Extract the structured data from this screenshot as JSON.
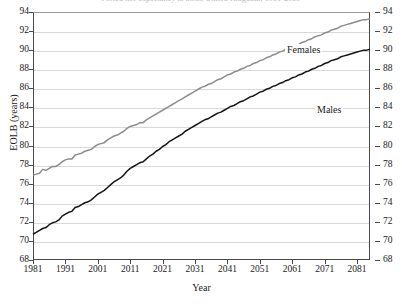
{
  "chart_data": {
    "type": "line",
    "title": "Period life expectancy at birth, United Kingdom, 1981-2085",
    "xlabel": "Year",
    "ylabel": "EOLB (years)",
    "xlim": [
      1981,
      2085
    ],
    "ylim": [
      68,
      94
    ],
    "ytick_step": 2,
    "grid": true,
    "legend_position": "inline-annotation",
    "yticks": [
      68,
      70,
      72,
      74,
      76,
      78,
      80,
      82,
      84,
      86,
      88,
      90,
      92,
      94
    ],
    "xticks": [
      1981,
      1991,
      2001,
      2011,
      2021,
      2031,
      2041,
      2051,
      2061,
      2071,
      2081
    ],
    "x": [
      1981,
      1982,
      1983,
      1984,
      1985,
      1986,
      1987,
      1988,
      1989,
      1990,
      1991,
      1992,
      1993,
      1994,
      1995,
      1996,
      1997,
      1998,
      1999,
      2000,
      2001,
      2002,
      2003,
      2004,
      2005,
      2006,
      2007,
      2008,
      2009,
      2010,
      2011,
      2012,
      2013,
      2014,
      2015,
      2016,
      2017,
      2018,
      2019,
      2020,
      2021,
      2022,
      2023,
      2024,
      2025,
      2026,
      2027,
      2028,
      2029,
      2030,
      2031,
      2032,
      2033,
      2034,
      2035,
      2036,
      2037,
      2038,
      2039,
      2040,
      2041,
      2042,
      2043,
      2044,
      2045,
      2046,
      2047,
      2048,
      2049,
      2050,
      2051,
      2052,
      2053,
      2054,
      2055,
      2056,
      2057,
      2058,
      2059,
      2060,
      2061,
      2062,
      2063,
      2064,
      2065,
      2066,
      2067,
      2068,
      2069,
      2070,
      2071,
      2072,
      2073,
      2074,
      2075,
      2076,
      2077,
      2078,
      2079,
      2080,
      2081,
      2082,
      2083,
      2084,
      2085
    ],
    "series": [
      {
        "name": "Females",
        "color": "#8c8c8c",
        "values": [
          76.9,
          77.0,
          77.1,
          77.5,
          77.4,
          77.6,
          77.8,
          77.8,
          78.0,
          78.3,
          78.5,
          78.6,
          78.6,
          79.0,
          79.1,
          79.2,
          79.4,
          79.5,
          79.6,
          79.9,
          80.1,
          80.2,
          80.3,
          80.6,
          80.8,
          81.0,
          81.1,
          81.3,
          81.5,
          81.8,
          82.0,
          82.1,
          82.2,
          82.4,
          82.4,
          82.7,
          82.9,
          83.1,
          83.3,
          83.5,
          83.7,
          83.9,
          84.1,
          84.3,
          84.5,
          84.7,
          84.9,
          85.1,
          85.3,
          85.5,
          85.7,
          85.9,
          86.1,
          86.2,
          86.4,
          86.5,
          86.7,
          86.9,
          87.0,
          87.2,
          87.4,
          87.5,
          87.7,
          87.8,
          88.0,
          88.1,
          88.3,
          88.4,
          88.6,
          88.7,
          88.9,
          89.0,
          89.2,
          89.3,
          89.5,
          89.6,
          89.8,
          89.9,
          90.1,
          90.2,
          90.4,
          90.5,
          90.6,
          90.8,
          90.9,
          91.1,
          91.2,
          91.4,
          91.5,
          91.6,
          91.8,
          91.9,
          92.1,
          92.2,
          92.3,
          92.5,
          92.6,
          92.7,
          92.8,
          92.9,
          93.0,
          93.1,
          93.2,
          93.2,
          93.3
        ]
      },
      {
        "name": "Males",
        "color": "#141414",
        "values": [
          70.7,
          70.9,
          71.1,
          71.3,
          71.4,
          71.7,
          71.9,
          72.0,
          72.2,
          72.6,
          72.8,
          73.0,
          73.1,
          73.5,
          73.6,
          73.8,
          74.0,
          74.1,
          74.3,
          74.6,
          74.9,
          75.1,
          75.3,
          75.6,
          75.9,
          76.2,
          76.4,
          76.6,
          76.9,
          77.3,
          77.6,
          77.8,
          78.0,
          78.2,
          78.3,
          78.6,
          78.9,
          79.1,
          79.4,
          79.6,
          79.9,
          80.1,
          80.4,
          80.6,
          80.8,
          81.0,
          81.2,
          81.5,
          81.7,
          81.9,
          82.1,
          82.3,
          82.5,
          82.7,
          82.8,
          83.0,
          83.2,
          83.4,
          83.5,
          83.7,
          83.9,
          84.1,
          84.2,
          84.4,
          84.6,
          84.7,
          84.9,
          85.1,
          85.2,
          85.4,
          85.6,
          85.7,
          85.9,
          86.0,
          86.2,
          86.3,
          86.5,
          86.6,
          86.8,
          86.9,
          87.1,
          87.2,
          87.4,
          87.5,
          87.7,
          87.8,
          88.0,
          88.1,
          88.3,
          88.4,
          88.6,
          88.7,
          88.9,
          89.0,
          89.1,
          89.3,
          89.4,
          89.5,
          89.6,
          89.7,
          89.8,
          89.9,
          90.0,
          90.0,
          90.1
        ]
      }
    ],
    "annotations": [
      {
        "text": "Females",
        "x": 2031,
        "y": 91.0
      },
      {
        "text": "Males",
        "x": 2048,
        "y": 84.8
      }
    ]
  }
}
